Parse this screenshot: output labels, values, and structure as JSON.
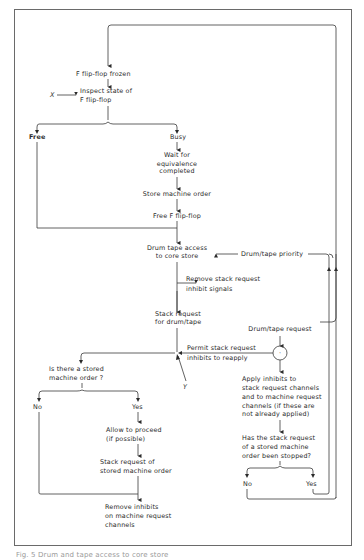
{
  "diagram": {
    "nodes": {
      "f_frozen": "F flip-flop frozen",
      "inspect_1": "Inspect state of",
      "inspect_2": "F flip-flop",
      "x_input": "X",
      "free": "Free",
      "busy": "Busy",
      "wait_1": "Wait for",
      "wait_2": "equivalence",
      "wait_3": "completed",
      "store_order": "Store machine order",
      "free_f": "Free F flip-flop",
      "drum_access_1": "Drum tape access",
      "drum_access_2": "to core store",
      "drum_priority": "Drum/tape priority",
      "remove_stack_1": "Remove stack request",
      "remove_stack_2": "inhibit signals",
      "stack_req_1": "Stack request",
      "stack_req_2": "for drum/tape",
      "drum_tape_request": "Drum/tape request",
      "permit_1": "Permit stack request",
      "permit_2": "inhibits to reapply",
      "y_input": "Y",
      "junction_symbol": "·",
      "is_stored_1": "Is there a stored",
      "is_stored_2": "machine order ?",
      "no_left": "No",
      "yes_left": "Yes",
      "allow_1": "Allow to proceed",
      "allow_2": "(if possible)",
      "stack_stored_1": "Stack request of",
      "stack_stored_2": "stored machine order",
      "remove_inhibits_1": "Remove inhibits",
      "remove_inhibits_2": "on machine request",
      "remove_inhibits_3": "channels",
      "apply_1": "Apply inhibits to",
      "apply_2": "stack request channels",
      "apply_3": "and to machine request",
      "apply_4": "channels (if these are",
      "apply_5": "not already applied)",
      "has_stopped_1": "Has the stack request",
      "has_stopped_2": "of a stored machine",
      "has_stopped_3": "order been stopped?",
      "no_right": "No",
      "yes_right": "Yes"
    },
    "caption": "Fig. 5  Drum and tape access to core store"
  }
}
